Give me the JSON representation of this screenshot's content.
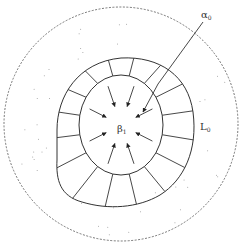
{
  "diagram": {
    "labels": {
      "alpha": {
        "base": "α",
        "sub": "0"
      },
      "beta": {
        "base": "β",
        "sub": "1"
      },
      "L": {
        "base": "L",
        "sub": "0"
      }
    },
    "arrow_count": 8,
    "segment_count": 16,
    "colors": {
      "stroke": "#333333",
      "dashed": "#555555",
      "dots": "#999999"
    }
  }
}
